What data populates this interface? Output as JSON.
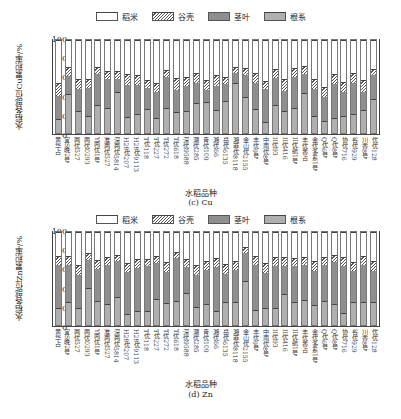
{
  "legend": {
    "items": [
      {
        "key": "rice",
        "label": "稻米"
      },
      {
        "key": "husk",
        "label": "谷壳"
      },
      {
        "key": "stem",
        "label": "茎叶"
      },
      {
        "key": "root",
        "label": "根系"
      }
    ]
  },
  "varieties": [
    "黄华占",
    "宜S晚2号",
    "两优527",
    "两优0293",
    "Y两优1号",
    "准两优527",
    "深两优5814",
    "H28优207",
    "H28优9113",
    "T优118",
    "T优227",
    "T优272",
    "T优618",
    "深优9588",
    "潮优285",
    "青优109",
    "湘优66",
    "岳优6135",
    "湘菲优8118",
    "金山优2155",
    "丰优9号",
    "中南优8号",
    "II优93",
    "II优416",
    "II优航1号",
    "丰优香占",
    "金优多系1号",
    "Q优6号",
    "Q优8号",
    "协优716",
    "谷优929",
    "川香8号",
    "优优128"
  ],
  "ticks": [
    "0",
    "20",
    "40",
    "60",
    "80",
    "100"
  ],
  "chart_data": [
    {
      "type": "bar",
      "stacked": true,
      "title": "(c) Cu",
      "xlabel": "水稻品种",
      "ylabel": "水稻各部位Cu累积率/%",
      "ylim": [
        0,
        100
      ],
      "legend_position": "top",
      "categories_ref": "varieties",
      "series": [
        {
          "name": "根系",
          "values": [
            14,
            42,
            23,
            18,
            30,
            27,
            44,
            17,
            20,
            26,
            16,
            27,
            22,
            23,
            32,
            33,
            24,
            34,
            54,
            39,
            26,
            11,
            30,
            23,
            27,
            43,
            18,
            12,
            16,
            18,
            20,
            24,
            37
          ]
        },
        {
          "name": "茎叶",
          "values": [
            26,
            20,
            25,
            31,
            34,
            32,
            15,
            35,
            32,
            23,
            29,
            34,
            25,
            28,
            23,
            14,
            27,
            19,
            12,
            24,
            29,
            37,
            30,
            23,
            34,
            21,
            30,
            27,
            37,
            27,
            35,
            21,
            26
          ]
        },
        {
          "name": "谷壳",
          "values": [
            13,
            9,
            10,
            9,
            7,
            8,
            8,
            11,
            10,
            8,
            8,
            7,
            12,
            9,
            10,
            10,
            11,
            7,
            5,
            7,
            10,
            8,
            9,
            12,
            9,
            8,
            10,
            10,
            10,
            10,
            10,
            12,
            6
          ]
        },
        {
          "name": "稻米",
          "values": [
            47,
            29,
            42,
            42,
            29,
            33,
            33,
            37,
            38,
            43,
            47,
            32,
            41,
            40,
            35,
            43,
            38,
            40,
            29,
            30,
            35,
            44,
            31,
            42,
            30,
            28,
            42,
            51,
            37,
            45,
            35,
            43,
            31
          ]
        }
      ],
      "subtitle": "(c) Cu"
    },
    {
      "type": "bar",
      "stacked": true,
      "title": "(d) Zn",
      "xlabel": "水稻品种",
      "ylabel": "水稻各部位Zn累积率/%",
      "ylim": [
        0,
        100
      ],
      "legend_position": "top",
      "categories_ref": "varieties",
      "series": [
        {
          "name": "根系",
          "values": [
            18,
            25,
            18,
            40,
            26,
            22,
            30,
            11,
            14,
            14,
            28,
            23,
            26,
            34,
            19,
            22,
            15,
            24,
            24,
            48,
            16,
            18,
            18,
            33,
            24,
            27,
            21,
            26,
            22,
            12,
            25,
            24,
            24
          ]
        },
        {
          "name": "茎叶",
          "values": [
            48,
            41,
            37,
            31,
            35,
            44,
            40,
            47,
            48,
            50,
            40,
            35,
            47,
            29,
            35,
            38,
            48,
            32,
            36,
            31,
            50,
            39,
            47,
            32,
            40,
            39,
            38,
            40,
            47,
            53,
            34,
            42,
            35
          ]
        },
        {
          "name": "谷壳",
          "values": [
            8,
            8,
            10,
            7,
            9,
            7,
            6,
            9,
            9,
            7,
            7,
            10,
            6,
            8,
            10,
            9,
            9,
            10,
            9,
            5,
            8,
            10,
            8,
            8,
            8,
            7,
            10,
            7,
            7,
            8,
            9,
            8,
            10
          ]
        },
        {
          "name": "稻米",
          "values": [
            26,
            26,
            35,
            22,
            30,
            27,
            24,
            33,
            29,
            29,
            25,
            32,
            21,
            29,
            36,
            31,
            28,
            34,
            31,
            16,
            26,
            33,
            27,
            27,
            28,
            27,
            31,
            27,
            24,
            27,
            32,
            26,
            31
          ]
        }
      ],
      "subtitle": "(d) Zn"
    }
  ]
}
